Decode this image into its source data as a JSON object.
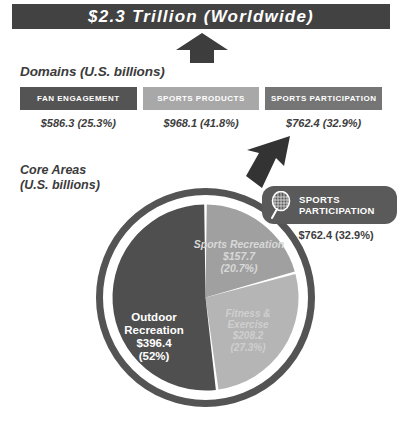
{
  "title_bar": {
    "text": "$2.3 Trillion (Worldwide)",
    "bg_color": "#424242",
    "text_color": "#ffffff"
  },
  "arrows": {
    "up_arrow": "up-arrow",
    "diagonal_arrow": "down-left-arrow",
    "color": "#3d3d3d"
  },
  "domains": {
    "heading": "Domains (U.S. billions)",
    "columns": [
      {
        "header": "FAN ENGAGEMENT",
        "value": "$586.3 (25.3%)",
        "header_bg": "#545454"
      },
      {
        "header": "SPORTS PRODUCTS",
        "value": "$968.1 (41.8%)",
        "header_bg": "#a8a8a8"
      },
      {
        "header": "SPORTS PARTICIPATION",
        "value": "$762.4 (32.9%)",
        "header_bg": "#757575"
      }
    ]
  },
  "core_areas": {
    "heading_line1": "Core Areas",
    "heading_line2": "(U.S. billions)"
  },
  "callout": {
    "icon": "tennis-racquet-icon",
    "label_line1": "SPORTS",
    "label_line2": "PARTICIPATION",
    "value": "$762.4 (32.9%)",
    "bg_color": "#5a5a5a"
  },
  "chart_data": {
    "type": "pie",
    "title": "Core Areas (U.S. billions)",
    "unit": "U.S. billions",
    "total": 762.4,
    "legend_position": "inside-slices",
    "ring_color": "#545454",
    "categories": [
      "Outdoor Recreation",
      "Fitness & Exercise",
      "Sports Recreation"
    ],
    "values": [
      396.4,
      208.2,
      157.7
    ],
    "percent_labels": [
      "52%",
      "27.3%",
      "20.7%"
    ],
    "value_labels": [
      "$396.4",
      "$208.2",
      "$157.7"
    ],
    "colors": [
      "#4f4f4f",
      "#b5b5b5",
      "#a0a0a0"
    ],
    "slices": [
      {
        "name": "Outdoor Recreation",
        "value": 396.4,
        "value_label": "$396.4",
        "percent": 52.0,
        "percent_label": "(52%)",
        "color": "#4f4f4f",
        "text_color": "#ffffff"
      },
      {
        "name": "Sports Recreation",
        "value": 157.7,
        "value_label": "$157.7",
        "percent": 20.7,
        "percent_label": "(20.7%)",
        "color": "#a0a0a0",
        "text_color": "#d8d8d8"
      },
      {
        "name": "Fitness & Exercise",
        "value": 208.2,
        "value_label": "$208.2",
        "percent": 27.3,
        "percent_label": "(27.3%)",
        "color": "#b5b5b5",
        "text_color": "#cfcfcf"
      }
    ]
  }
}
